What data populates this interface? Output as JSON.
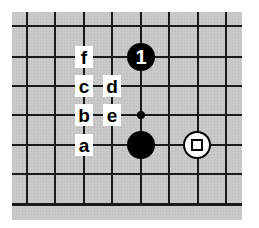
{
  "diagram": {
    "type": "go-board-fragment",
    "board_color": "#c9c9c9",
    "line_color": "#1a1a1a",
    "grid": {
      "vertical_x": [
        27,
        55.5,
        84,
        112.5,
        141,
        169.5,
        198,
        226.5
      ],
      "horizontal_y": [
        26,
        57,
        86,
        115,
        145,
        174,
        204
      ]
    },
    "stones": [
      {
        "color": "black",
        "col": 4,
        "row": 1,
        "label": "1"
      },
      {
        "color": "black",
        "col": 4,
        "row": 4,
        "label": ""
      },
      {
        "color": "white",
        "col": 6,
        "row": 4,
        "marker": "square"
      }
    ],
    "markers": [
      {
        "type": "small-dot",
        "col": 4,
        "row": 3
      }
    ],
    "labels": [
      {
        "text": "f",
        "col": 2,
        "row": 1
      },
      {
        "text": "c",
        "col": 2,
        "row": 2
      },
      {
        "text": "d",
        "col": 3,
        "row": 2
      },
      {
        "text": "b",
        "col": 2,
        "row": 3
      },
      {
        "text": "e",
        "col": 3,
        "row": 3
      },
      {
        "text": "a",
        "col": 2,
        "row": 4
      }
    ]
  }
}
